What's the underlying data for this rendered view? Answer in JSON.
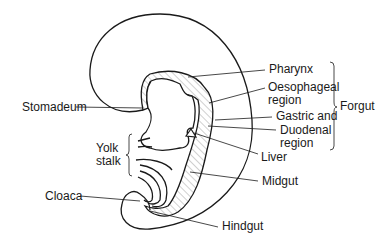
{
  "diagram": {
    "type": "embryo gut tube schematic",
    "labels": {
      "pharynx": "Pharynx",
      "oesophageal_1": "Oesophageal",
      "oesophageal_2": "region",
      "gastric": "Gastric and",
      "duodenal_1": "Duodenal",
      "duodenal_2": "region",
      "forgut": "Forgut",
      "stomadeum": "Stomadeum",
      "yolk_1": "Yolk",
      "yolk_2": "stalk",
      "liver": "Liver",
      "midgut": "Midgut",
      "cloaca": "Cloaca",
      "hindgut": "Hindgut"
    },
    "colors": {
      "line": "#1a1a1a",
      "hatch": "#8a8a8a",
      "background": "#ffffff"
    }
  }
}
